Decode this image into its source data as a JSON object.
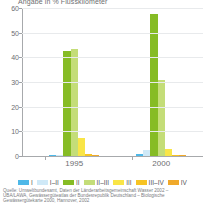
{
  "chart_data": {
    "type": "bar",
    "title": "Angabe in % Flusskilometer",
    "xlabel": "",
    "ylabel": "",
    "ylim": [
      0,
      60
    ],
    "yticks": [
      0,
      10,
      20,
      30,
      40,
      50,
      60
    ],
    "ytick_labels": [
      "0",
      "10",
      "20",
      "30",
      "40",
      "50",
      "60"
    ],
    "grid": true,
    "legend_position": "bottom",
    "categories": [
      "1995",
      "2000"
    ],
    "series": [
      {
        "name": "I",
        "color": "#4eb8e8",
        "values": [
          0.6,
          0.7
        ]
      },
      {
        "name": "I–II",
        "color": "#cfe9f7",
        "values": [
          0.4,
          2.5
        ]
      },
      {
        "name": "II",
        "color": "#86bc25",
        "values": [
          42.5,
          57.5
        ]
      },
      {
        "name": "II–III",
        "color": "#c4dd78",
        "values": [
          43.5,
          31.0
        ]
      },
      {
        "name": "III",
        "color": "#f9e547",
        "values": [
          7.5,
          2.8
        ]
      },
      {
        "name": "III–IV",
        "color": "#f7c324",
        "values": [
          1.0,
          0.4
        ]
      },
      {
        "name": "IV",
        "color": "#f0a92b",
        "values": [
          0.3,
          0.2
        ]
      }
    ],
    "source": [
      "Quelle: Umweltbundesamt, Daten der Länderarbeitsgemeinschaft Wasser 2002 –",
      "UBA/LAWA, Gewässergüteatlas der Bundesrepublik Deutschland – Biologische",
      "Gewässergütekarte 2000, Hannover, 2002"
    ]
  }
}
